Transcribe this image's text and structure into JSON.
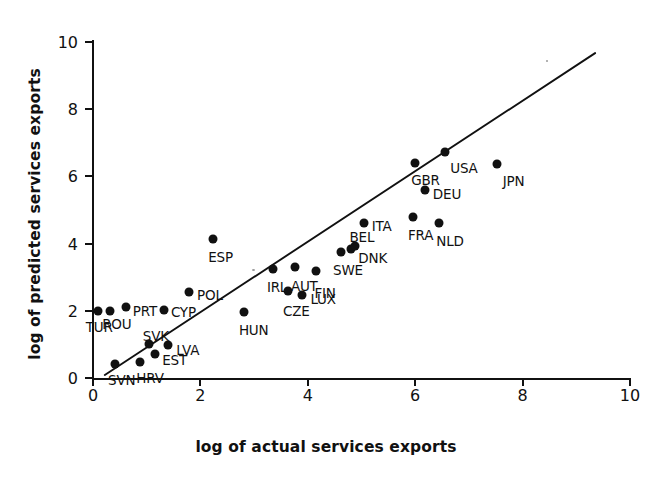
{
  "chart_data": {
    "type": "scatter",
    "title": "",
    "xlabel": "log of actual services exports",
    "ylabel": "log of predicted services exports",
    "xlim": [
      0,
      10
    ],
    "ylim": [
      0,
      10
    ],
    "xticks": [
      0,
      2,
      4,
      6,
      8,
      10
    ],
    "yticks": [
      0,
      2,
      4,
      6,
      8,
      10
    ],
    "grid": false,
    "legend": "none",
    "point_label_field": "country",
    "points": [
      {
        "country": "TUR",
        "x": 0.09,
        "y": 2.0,
        "label_dx": -12,
        "label_dy": 16
      },
      {
        "country": "ROU",
        "x": 0.32,
        "y": 2.0,
        "label_dx": -8,
        "label_dy": 13
      },
      {
        "country": "PRT",
        "x": 0.61,
        "y": 2.12,
        "label_dx": 7,
        "label_dy": 4
      },
      {
        "country": "SVN",
        "x": 0.41,
        "y": 0.42,
        "label_dx": -7,
        "label_dy": 16
      },
      {
        "country": "HRV",
        "x": 0.88,
        "y": 0.48,
        "label_dx": -4,
        "label_dy": 16
      },
      {
        "country": "SVK",
        "x": 1.04,
        "y": 1.0,
        "label_dx": -6,
        "label_dy": -8
      },
      {
        "country": "EST",
        "x": 1.16,
        "y": 0.7,
        "label_dx": 7,
        "label_dy": 6
      },
      {
        "country": "LVA",
        "x": 1.4,
        "y": 0.97,
        "label_dx": 8,
        "label_dy": 5
      },
      {
        "country": "CYP",
        "x": 1.32,
        "y": 2.03,
        "label_dx": 7,
        "label_dy": 2
      },
      {
        "country": "POL",
        "x": 1.79,
        "y": 2.56,
        "label_dx": 8,
        "label_dy": 3
      },
      {
        "country": "ESP",
        "x": 2.24,
        "y": 4.15,
        "label_dx": -5,
        "label_dy": 18
      },
      {
        "country": "HUN",
        "x": 2.81,
        "y": 1.97,
        "label_dx": -5,
        "label_dy": 18
      },
      {
        "country": "IRL",
        "x": 3.35,
        "y": 3.25,
        "label_dx": -6,
        "label_dy": 18
      },
      {
        "country": "CZE",
        "x": 3.63,
        "y": 2.59,
        "label_dx": -5,
        "label_dy": 20
      },
      {
        "country": "AUT",
        "x": 3.76,
        "y": 3.31,
        "label_dx": -4,
        "label_dy": 19
      },
      {
        "country": "LUX",
        "x": 3.9,
        "y": 2.46,
        "label_dx": 8,
        "label_dy": 4
      },
      {
        "country": "FIN",
        "x": 4.16,
        "y": 3.19,
        "label_dx": -2,
        "label_dy": 22
      },
      {
        "country": "SWE",
        "x": 4.62,
        "y": 3.76,
        "label_dx": -8,
        "label_dy": 18
      },
      {
        "country": "DNK",
        "x": 4.81,
        "y": 3.85,
        "label_dx": 7,
        "label_dy": 9
      },
      {
        "country": "BEL",
        "x": 4.87,
        "y": 3.94,
        "label_dx": -5,
        "label_dy": -9
      },
      {
        "country": "ITA",
        "x": 5.04,
        "y": 4.6,
        "label_dx": 8,
        "label_dy": 3
      },
      {
        "country": "GBR",
        "x": 6.0,
        "y": 6.4,
        "label_dx": -4,
        "label_dy": 17
      },
      {
        "country": "DEU",
        "x": 6.18,
        "y": 5.6,
        "label_dx": 8,
        "label_dy": 4
      },
      {
        "country": "FRA",
        "x": 5.96,
        "y": 4.78,
        "label_dx": -5,
        "label_dy": 18
      },
      {
        "country": "NLD",
        "x": 6.45,
        "y": 4.6,
        "label_dx": -3,
        "label_dy": 18
      },
      {
        "country": "USA",
        "x": 6.56,
        "y": 6.72,
        "label_dx": 5,
        "label_dy": 16
      },
      {
        "country": "JPN",
        "x": 7.52,
        "y": 6.37,
        "label_dx": 6,
        "label_dy": 17
      }
    ],
    "fit_line": {
      "x0": 0.22,
      "y0": 0.09,
      "x1": 9.35,
      "y1": 9.67
    }
  },
  "axes": {
    "x": {
      "title": "log of actual services exports",
      "tick_labels": [
        "0",
        "2",
        "4",
        "6",
        "8",
        "10"
      ]
    },
    "y": {
      "title": "log of predicted services exports",
      "tick_labels": [
        "0",
        "2",
        "4",
        "6",
        "8",
        "10"
      ]
    }
  }
}
